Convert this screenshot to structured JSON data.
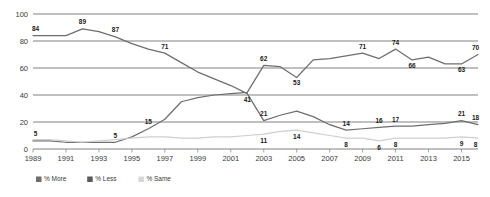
{
  "chart_data": {
    "type": "line",
    "title": "",
    "xlabel": "",
    "ylabel": "",
    "ylim": [
      0,
      100
    ],
    "yticks": [
      0,
      20,
      40,
      60,
      80,
      100
    ],
    "grid": true,
    "legend_position": "bottom-left",
    "x": [
      1989,
      1990,
      1991,
      1992,
      1993,
      1994,
      1995,
      1996,
      1997,
      1998,
      1999,
      2000,
      2001,
      2002,
      2003,
      2004,
      2005,
      2006,
      2007,
      2008,
      2009,
      2010,
      2011,
      2012,
      2013,
      2014,
      2015,
      2016
    ],
    "xticks": [
      "1989",
      "1991",
      "1993",
      "1995",
      "1997",
      "1999",
      "2001",
      "2003",
      "2005",
      "2007",
      "2009",
      "2011",
      "2013",
      "2015"
    ],
    "series": [
      {
        "name": "% More",
        "color": "#6e6e6e",
        "values": [
          84,
          84,
          84,
          89,
          87,
          83,
          78,
          74,
          71,
          64,
          57,
          52,
          47,
          41,
          21,
          25,
          28,
          24,
          18,
          14,
          15,
          16,
          17,
          17,
          18,
          19,
          21,
          18
        ],
        "labels": [
          {
            "x": 1989,
            "value": 84
          },
          {
            "x": 1992,
            "value": 89
          },
          {
            "x": 1994,
            "value": 87
          },
          {
            "x": 1997,
            "value": 71
          },
          {
            "x": 2002,
            "value": 41
          },
          {
            "x": 2003,
            "value": 21
          },
          {
            "x": 2008,
            "value": 14
          },
          {
            "x": 2010,
            "value": 16
          },
          {
            "x": 2011,
            "value": 17
          },
          {
            "x": 2015,
            "value": 21
          },
          {
            "x": 2016,
            "value": 18
          }
        ]
      },
      {
        "name": "% Less",
        "color": "#6e6e6e",
        "values": [
          6,
          6,
          5,
          5,
          5,
          5,
          9,
          15,
          22,
          35,
          38,
          40,
          41,
          42,
          62,
          61,
          53,
          66,
          67,
          69,
          71,
          67,
          74,
          66,
          68,
          63,
          63,
          70
        ],
        "labels": [
          {
            "x": 1989,
            "value": 5
          },
          {
            "x": 1994,
            "value": 5
          },
          {
            "x": 1996,
            "value": 15
          },
          {
            "x": 2003,
            "value": 62
          },
          {
            "x": 2005,
            "value": 53
          },
          {
            "x": 2009,
            "value": 71
          },
          {
            "x": 2011,
            "value": 74
          },
          {
            "x": 2012,
            "value": 66
          },
          {
            "x": 2015,
            "value": 63
          },
          {
            "x": 2016,
            "value": 70
          }
        ]
      },
      {
        "name": "% Same",
        "color": "#cfcfcf",
        "values": [
          7,
          7,
          6,
          5,
          6,
          7,
          8,
          9,
          9,
          8,
          8,
          9,
          9,
          10,
          11,
          13,
          14,
          12,
          10,
          8,
          8,
          6,
          8,
          8,
          8,
          8,
          9,
          8
        ],
        "labels": [
          {
            "x": 2003,
            "value": 11
          },
          {
            "x": 2005,
            "value": 14
          },
          {
            "x": 2008,
            "value": 8
          },
          {
            "x": 2010,
            "value": 6
          },
          {
            "x": 2011,
            "value": 8
          },
          {
            "x": 2015,
            "value": 9
          },
          {
            "x": 2016,
            "value": 8
          }
        ]
      }
    ]
  },
  "legend": {
    "items": [
      {
        "label": "% More",
        "color": "#6e6e6e"
      },
      {
        "label": "% Less",
        "color": "#5a5a5a"
      },
      {
        "label": "% Same",
        "color": "#d8d8d8"
      }
    ]
  }
}
